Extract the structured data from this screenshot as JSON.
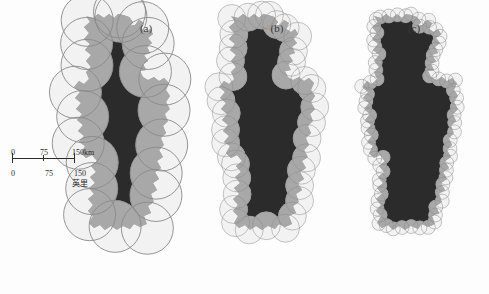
{
  "figure": {
    "background_color": "#fdfdfd",
    "land_color": "#2b2b2b",
    "circle_fill_color": "#f2f2f2",
    "circle_overlap_color": "#a8a8a8",
    "circle_stroke_color": "#8a8a8a"
  },
  "panels": [
    {
      "id": "a",
      "label": "(a)",
      "label_x": 146,
      "label_y": 32,
      "circle_radius": 26,
      "circle_count": 28,
      "origin_x": 60,
      "origin_y": 14,
      "scale": 1.0
    },
    {
      "id": "b",
      "label": "(b)",
      "label_x": 277,
      "label_y": 32,
      "circle_radius": 14,
      "circle_count": 62,
      "origin_x": 205,
      "origin_y": 14,
      "scale": 1.0
    },
    {
      "id": "c",
      "label": "(c)",
      "label_x": 414,
      "label_y": 32,
      "circle_radius": 7,
      "circle_count": 140,
      "origin_x": 348,
      "origin_y": 14,
      "scale": 1.0
    }
  ],
  "scale_bar": {
    "x": 12,
    "y": 158,
    "width": 62,
    "top_unit": "150km",
    "bottom_unit": "英里",
    "top_labels": [
      "0",
      "75",
      "150km"
    ],
    "bottom_labels": [
      "0",
      "75",
      "150"
    ],
    "top_ticks": [
      0,
      75,
      150
    ],
    "bottom_ticks": [
      0,
      75,
      150
    ],
    "km_max": 150,
    "miles_max": 150
  },
  "chart_data": {
    "type": "map",
    "method": "circle covering / Richardson fractal dimension",
    "panels": [
      {
        "label": "(a)",
        "radius_px": 26,
        "approx_radius_km": 75,
        "circles": 28
      },
      {
        "label": "(b)",
        "radius_px": 14,
        "approx_radius_km": 40,
        "circles": 62
      },
      {
        "label": "(c)",
        "radius_px": 7,
        "approx_radius_km": 20,
        "circles": 140
      }
    ],
    "scale": {
      "km": [
        0,
        75,
        150
      ],
      "miles": [
        0,
        75,
        150
      ],
      "miles_label": "英里",
      "km_label": "150km"
    }
  }
}
